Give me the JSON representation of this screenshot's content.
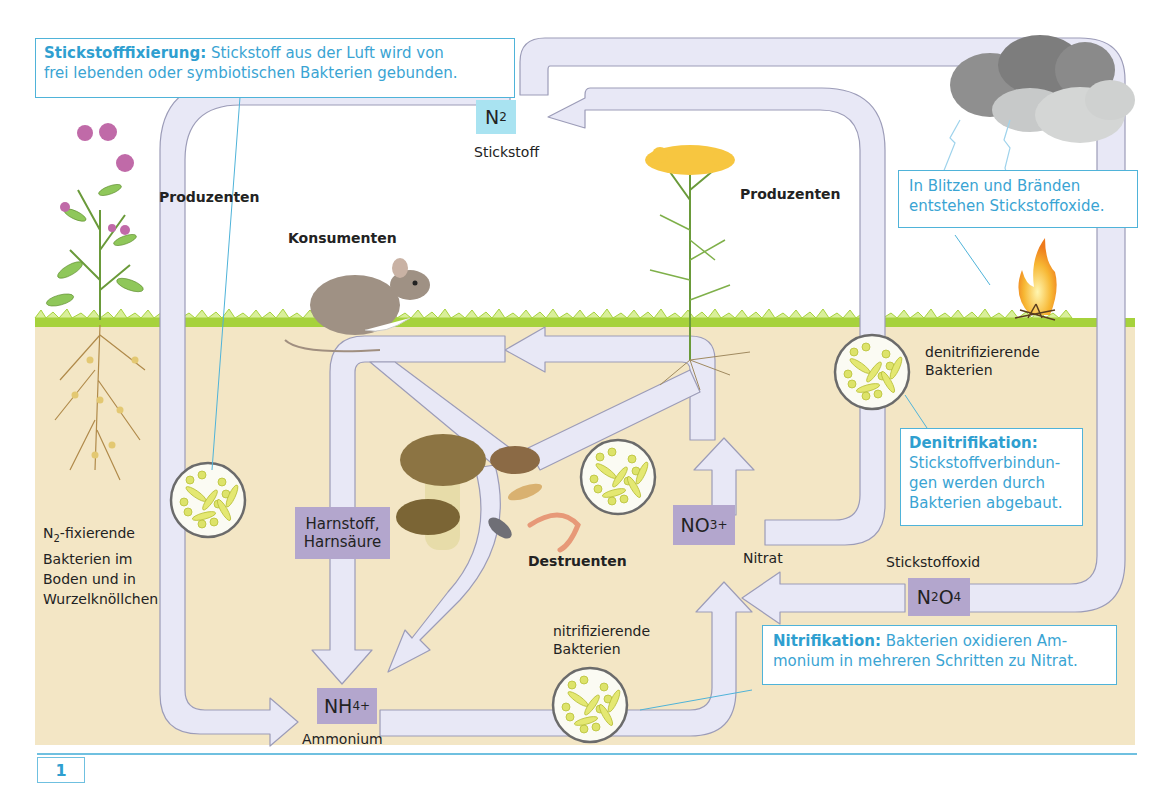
{
  "figure": {
    "number": "1",
    "colors": {
      "soil": "#f3e6c5",
      "grass": "#a6d23c",
      "arrow_fill": "#e8e8f6",
      "arrow_stroke": "#9c9cb8",
      "chem_box": "#b3a6cd",
      "n2_box": "#a9e3f1",
      "callout_border": "#4fb3d9",
      "callout_text": "#3aa4d3"
    }
  },
  "callouts": {
    "fixation": {
      "heading": "Stickstofffixierung:",
      "text_line1": " Stickstoff aus der Luft wird von",
      "text_line2": "frei lebenden oder symbiotischen Bakterien gebunden."
    },
    "lightning": {
      "line1": "In Blitzen und Bränden",
      "line2": "entstehen Stickstoffoxide."
    },
    "denitrification": {
      "heading": "Denitrifikation:",
      "line1": "Stickstoffverbindun-",
      "line2": "gen werden durch",
      "line3": "Bakterien abgebaut."
    },
    "nitrification": {
      "heading": "Nitrifikation:",
      "text_line1": " Bakterien oxidieren Am-",
      "text_line2": "monium in mehreren Schritten zu Nitrat."
    }
  },
  "compounds": {
    "n2": {
      "base": "N",
      "sub": "2",
      "label": "Stickstoff"
    },
    "nh4": {
      "base": "NH",
      "sub": "4",
      "sup": "+",
      "label": "Ammonium"
    },
    "no3": {
      "base": "NO",
      "sub": "3",
      "sup": "+",
      "label": "Nitrat"
    },
    "n2o4": {
      "p1": "N",
      "s1": "2",
      "p2": "O",
      "s2": "4",
      "label": "Stickstoffoxid"
    },
    "urea": {
      "line1": "Harnstoff,",
      "line2": "Harnsäure"
    }
  },
  "labels": {
    "producers_left": "Produzenten",
    "producers_right": "Produzenten",
    "consumers": "Konsumenten",
    "decomposers": "Destruenten",
    "fixing_bacteria": {
      "prefix": "N",
      "sub": "2",
      "line1_rest": "-fixierende",
      "line2": "Bakterien im",
      "line3": "Boden und in",
      "line4": "Wurzelknöllchen"
    },
    "denitrifying_bacteria": {
      "line1": "denitrifizierende",
      "line2": "Bakterien"
    },
    "nitrifying_bacteria": {
      "line1": "nitrifizierende",
      "line2": "Bakterien"
    }
  }
}
